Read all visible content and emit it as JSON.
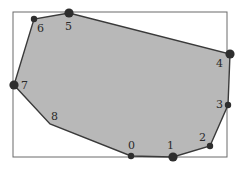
{
  "diagram": {
    "type": "convex-polygon-in-bounding-box",
    "colors": {
      "fill": "#b8b8b8",
      "stroke": "#3a3a3a",
      "box": "#6a6a6a",
      "vertex": "#2e2e2e"
    },
    "bounding_box": {
      "x": 13,
      "y": 12,
      "width": 214,
      "height": 145
    },
    "vertices": [
      {
        "id": "0",
        "x": 131,
        "y": 156,
        "r": 3.2,
        "lx": 128,
        "ly": 149
      },
      {
        "id": "1",
        "x": 173,
        "y": 157,
        "r": 4.6,
        "lx": 167,
        "ly": 149
      },
      {
        "id": "2",
        "x": 210,
        "y": 146,
        "r": 3.2,
        "lx": 199,
        "ly": 141
      },
      {
        "id": "3",
        "x": 228,
        "y": 105,
        "r": 3.2,
        "lx": 216,
        "ly": 108
      },
      {
        "id": "4",
        "x": 230,
        "y": 54,
        "r": 4.6,
        "lx": 216,
        "ly": 67
      },
      {
        "id": "5",
        "x": 69,
        "y": 13,
        "r": 4.6,
        "lx": 65,
        "ly": 30
      },
      {
        "id": "6",
        "x": 34,
        "y": 19,
        "r": 3.2,
        "lx": 37,
        "ly": 32
      },
      {
        "id": "7",
        "x": 14,
        "y": 85,
        "r": 4.6,
        "lx": 21,
        "ly": 89
      },
      {
        "id": "8",
        "x": 50,
        "y": 124,
        "r": 0,
        "lx": 51,
        "ly": 120
      }
    ]
  }
}
